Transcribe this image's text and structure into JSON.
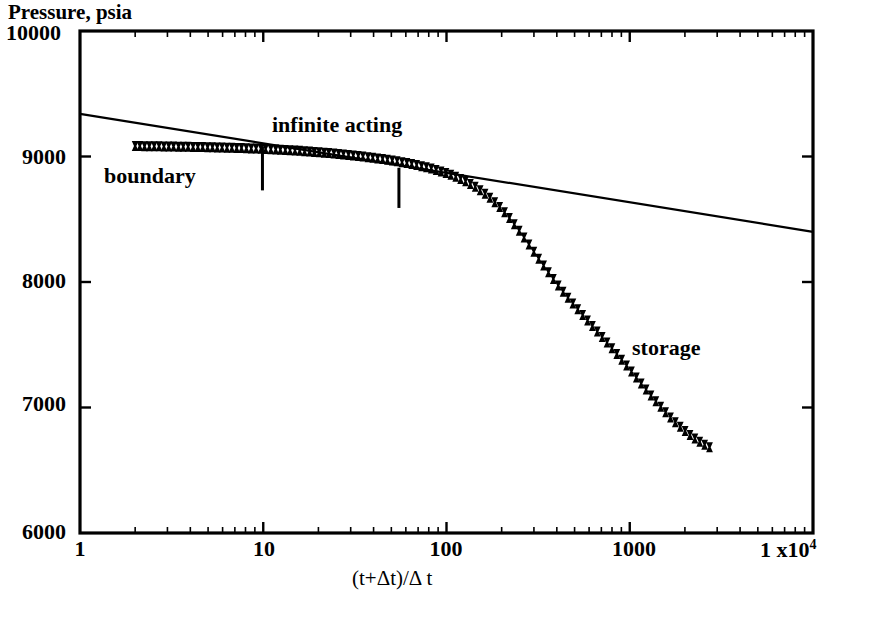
{
  "chart_data": {
    "type": "scatter",
    "title": "",
    "xlabel": "(t+Δt)/Δ t",
    "ylabel": "Pressure, psia",
    "xscale": "log",
    "yscale": "linear",
    "xlim": [
      1,
      10000
    ],
    "ylim": [
      6000,
      10000
    ],
    "grid": false,
    "legend": null,
    "xticks": [
      {
        "value": 1,
        "label": "1"
      },
      {
        "value": 10,
        "label": "10"
      },
      {
        "value": 100,
        "label": "100"
      },
      {
        "value": 1000,
        "label": "1000"
      },
      {
        "value": 10000,
        "label": "1 x10",
        "exponent": "4"
      }
    ],
    "yticks": [
      {
        "value": 10000,
        "label": "10000"
      },
      {
        "value": 9000,
        "label": "9000"
      },
      {
        "value": 8000,
        "label": "8000"
      },
      {
        "value": 7000,
        "label": "7000"
      },
      {
        "value": 6000,
        "label": "6000"
      }
    ],
    "annotations": [
      {
        "name": "boundary",
        "text": "boundary",
        "x": 3.2,
        "y": 8780
      },
      {
        "name": "infinite-acting",
        "text": "infinite acting",
        "x": 13.5,
        "y": 9180
      },
      {
        "name": "storage",
        "text": "storage",
        "x": 560,
        "y": 7430
      }
    ],
    "region_markers": [
      {
        "name": "boundary-to-infinite-acting-divider",
        "x": 9.9,
        "y_top": 9080,
        "y_bottom": 8730
      },
      {
        "name": "infinite-acting-to-storage-divider",
        "x": 55.0,
        "y_top": 8910,
        "y_bottom": 8590
      }
    ],
    "series": [
      {
        "name": "semilog-straight-line",
        "type": "line",
        "style": "solid",
        "color": "#000000",
        "points": [
          [
            1,
            9340
          ],
          [
            10000,
            8400
          ]
        ]
      },
      {
        "name": "buildup-pressure-data",
        "type": "scatter",
        "marker": "bowtie",
        "color": "#000000",
        "points": [
          [
            2.0,
            9083
          ],
          [
            2.12,
            9083
          ],
          [
            2.25,
            9082
          ],
          [
            2.39,
            9082
          ],
          [
            2.54,
            9081
          ],
          [
            2.7,
            9081
          ],
          [
            2.87,
            9080
          ],
          [
            3.05,
            9080
          ],
          [
            3.24,
            9079
          ],
          [
            3.45,
            9078
          ],
          [
            3.66,
            9078
          ],
          [
            3.89,
            9077
          ],
          [
            4.14,
            9076
          ],
          [
            4.4,
            9076
          ],
          [
            4.67,
            9075
          ],
          [
            4.97,
            9074
          ],
          [
            5.28,
            9073
          ],
          [
            5.61,
            9072
          ],
          [
            5.96,
            9071
          ],
          [
            6.34,
            9070
          ],
          [
            6.74,
            9069
          ],
          [
            7.16,
            9068
          ],
          [
            7.61,
            9067
          ],
          [
            8.09,
            9066
          ],
          [
            8.6,
            9064
          ],
          [
            9.14,
            9063
          ],
          [
            9.71,
            9061
          ],
          [
            10.3,
            9060
          ],
          [
            11.0,
            9058
          ],
          [
            11.7,
            9056
          ],
          [
            12.4,
            9054
          ],
          [
            13.2,
            9052
          ],
          [
            14.0,
            9049
          ],
          [
            14.9,
            9047
          ],
          [
            15.8,
            9045
          ],
          [
            16.8,
            9042
          ],
          [
            17.9,
            9039
          ],
          [
            19.0,
            9036
          ],
          [
            20.2,
            9033
          ],
          [
            21.5,
            9030
          ],
          [
            22.8,
            9027
          ],
          [
            24.3,
            9023
          ],
          [
            25.8,
            9020
          ],
          [
            27.4,
            9016
          ],
          [
            29.2,
            9012
          ],
          [
            31.0,
            9008
          ],
          [
            33.0,
            9004
          ],
          [
            35.0,
            9000
          ],
          [
            37.3,
            8995
          ],
          [
            39.6,
            8990
          ],
          [
            42.1,
            8985
          ],
          [
            44.8,
            8980
          ],
          [
            47.6,
            8974
          ],
          [
            50.6,
            8968
          ],
          [
            53.8,
            8962
          ],
          [
            57.2,
            8955
          ],
          [
            60.8,
            8948
          ],
          [
            64.6,
            8940
          ],
          [
            68.7,
            8932
          ],
          [
            73.1,
            8923
          ],
          [
            77.7,
            8914
          ],
          [
            82.6,
            8904
          ],
          [
            87.8,
            8893
          ],
          [
            93.4,
            8881
          ],
          [
            99.3,
            8868
          ],
          [
            105.6,
            8854
          ],
          [
            112.3,
            8838
          ],
          [
            119.4,
            8821
          ],
          [
            127.0,
            8802
          ],
          [
            135.0,
            8781
          ],
          [
            143.5,
            8758
          ],
          [
            152.6,
            8732
          ],
          [
            162.3,
            8703
          ],
          [
            172.5,
            8671
          ],
          [
            183.4,
            8636
          ],
          [
            195.0,
            8597
          ],
          [
            207.4,
            8555
          ],
          [
            220.5,
            8509
          ],
          [
            234.4,
            8460
          ],
          [
            249.3,
            8408
          ],
          [
            265.0,
            8354
          ],
          [
            281.8,
            8298
          ],
          [
            299.6,
            8242
          ],
          [
            318.5,
            8186
          ],
          [
            338.7,
            8131
          ],
          [
            360.1,
            8077
          ],
          [
            382.9,
            8024
          ],
          [
            407.2,
            7973
          ],
          [
            432.9,
            7923
          ],
          [
            460.3,
            7875
          ],
          [
            489.4,
            7828
          ],
          [
            520.4,
            7782
          ],
          [
            553.3,
            7737
          ],
          [
            588.3,
            7693
          ],
          [
            625.5,
            7649
          ],
          [
            665.0,
            7605
          ],
          [
            707.1,
            7561
          ],
          [
            751.8,
            7517
          ],
          [
            799.3,
            7472
          ],
          [
            849.9,
            7427
          ],
          [
            903.6,
            7381
          ],
          [
            960.8,
            7334
          ],
          [
            1021.5,
            7287
          ],
          [
            1086.1,
            7239
          ],
          [
            1154.8,
            7191
          ],
          [
            1227.8,
            7143
          ],
          [
            1305.4,
            7096
          ],
          [
            1387.9,
            7050
          ],
          [
            1475.7,
            7005
          ],
          [
            1569.0,
            6962
          ],
          [
            1668.2,
            6921
          ],
          [
            1773.7,
            6882
          ],
          [
            1885.9,
            6846
          ],
          [
            2005.1,
            6812
          ],
          [
            2131.9,
            6781
          ],
          [
            2266.7,
            6753
          ],
          [
            2410.0,
            6727
          ],
          [
            2562.4,
            6704
          ],
          [
            2724.4,
            6683
          ]
        ]
      }
    ]
  },
  "axis_titles": {
    "y": "Pressure, psia",
    "x": "(t+Δt)/Δ t"
  }
}
